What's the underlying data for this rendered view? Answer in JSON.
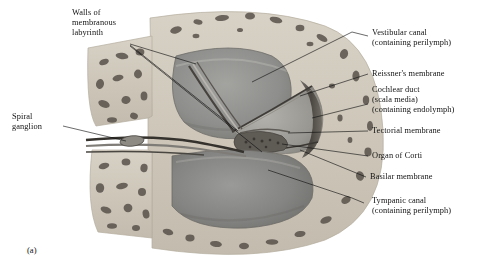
{
  "figure": {
    "marker": "(a)",
    "style": "grayscale-histology-illustration"
  },
  "labels_left": [
    {
      "id": "walls-of-membranous-labyrinth",
      "lines": [
        "Walls of",
        "membranous",
        "labyrinth"
      ],
      "x": 72,
      "y": 8
    },
    {
      "id": "spiral-ganglion",
      "lines": [
        "Spiral",
        "ganglion"
      ],
      "x": 12,
      "y": 112
    }
  ],
  "labels_right": [
    {
      "id": "vestibular-canal",
      "lines": [
        "Vestibular canal",
        "(containing perilymph)"
      ],
      "x": 372,
      "y": 28
    },
    {
      "id": "reissners-membrane",
      "lines": [
        "Reissner's membrane"
      ],
      "x": 370,
      "y": 70
    },
    {
      "id": "cochlear-duct",
      "lines": [
        "Cochlear duct",
        "(scala media)",
        "(containing endolymph)"
      ],
      "x": 370,
      "y": 86
    },
    {
      "id": "tectorial-membrane",
      "lines": [
        "Tectorial membrane"
      ],
      "x": 370,
      "y": 127
    },
    {
      "id": "organ-of-corti",
      "lines": [
        "Organ of Corti"
      ],
      "x": 370,
      "y": 152
    },
    {
      "id": "basilar-membrane",
      "lines": [
        "Basilar membrane"
      ],
      "x": 368,
      "y": 173
    },
    {
      "id": "tympanic-canal",
      "lines": [
        "Tympanic canal",
        "(containing perilymph)"
      ],
      "x": 370,
      "y": 198
    }
  ],
  "colors": {
    "background": "#ffffff",
    "bone": "#cfc8bb",
    "bone_speckle": "#5d574f",
    "lumen_gray": "#8d8d8d",
    "lumen_light": "#a9a9a6",
    "membrane_dark": "#4a4743",
    "stria_dark": "#47433e",
    "leader_line": "#0f0f0f",
    "text": "#131313"
  }
}
